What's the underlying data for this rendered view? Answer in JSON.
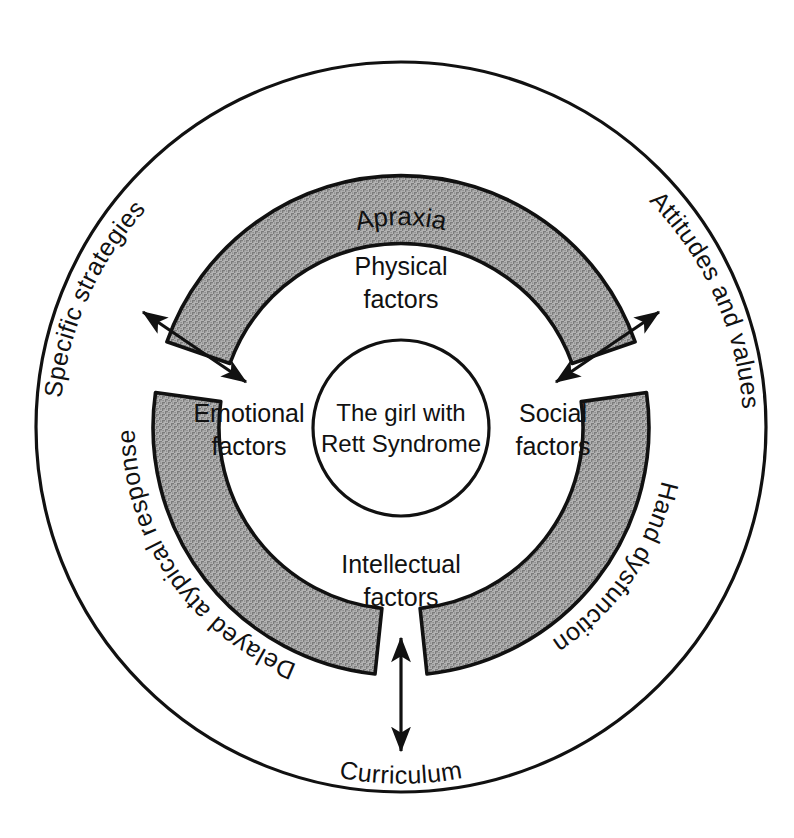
{
  "diagram": {
    "type": "concentric-ring-diagram",
    "colors": {
      "shaded_arc_fill": "#9a9a9a",
      "stroke": "#111111",
      "background": "#ffffff"
    },
    "center": {
      "line1": "The girl with",
      "line2": "Rett Syndrome"
    },
    "inner_factors": [
      {
        "key": "physical",
        "line1": "Physical",
        "line2": "factors",
        "position": "top"
      },
      {
        "key": "emotional",
        "line1": "Emotional",
        "line2": "factors",
        "position": "left"
      },
      {
        "key": "social",
        "line1": "Social",
        "line2": "factors",
        "position": "right"
      },
      {
        "key": "intellectual",
        "line1": "Intellectual",
        "line2": "factors",
        "position": "bottom"
      }
    ],
    "shaded_arc_labels": [
      {
        "key": "apraxia",
        "label": "Apraxia",
        "position": "top"
      },
      {
        "key": "delayed-atypical-response",
        "label": "Delayed atypical response",
        "position": "left"
      },
      {
        "key": "hand-dysfunction",
        "label": "Hand dysfunction",
        "position": "right"
      }
    ],
    "outer_ring_labels": [
      {
        "key": "specific-strategies",
        "label": "Specific strategies",
        "position": "upper-left"
      },
      {
        "key": "attitudes-and-values",
        "label": "Attitudes and values",
        "position": "upper-right"
      },
      {
        "key": "curriculum",
        "label": "Curriculum",
        "position": "bottom"
      }
    ],
    "arrows": [
      {
        "key": "specific-strategies-arrow",
        "style": "double-headed",
        "position": "upper-left-gap"
      },
      {
        "key": "attitudes-and-values-arrow",
        "style": "double-headed",
        "position": "upper-right-gap"
      },
      {
        "key": "curriculum-arrow",
        "style": "double-headed",
        "position": "bottom-gap"
      }
    ]
  }
}
